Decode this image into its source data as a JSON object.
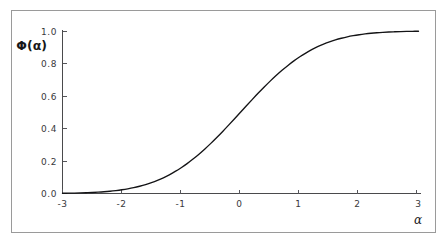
{
  "figure": {
    "background_color": "#ffffff",
    "frame_color": "#9a9a9a",
    "curve_color": "#141416",
    "axis_color": "#4a4a4c",
    "text_color": "#39393b"
  },
  "labels": {
    "y_axis_title": "Φ(α)",
    "x_axis_title": "α"
  },
  "ticks": {
    "x": [
      "-3",
      "-2",
      "-1",
      "0",
      "1",
      "2",
      "3"
    ],
    "y": [
      "0.0",
      "0.2",
      "0.4",
      "0.6",
      "0.8",
      "1.0"
    ]
  },
  "chart_data": {
    "type": "line",
    "title": "",
    "subtitle": "",
    "xlabel": "α",
    "ylabel": "Φ(α)",
    "xlim": [
      -3,
      3
    ],
    "ylim": [
      0.0,
      1.0
    ],
    "xticks": [
      -3,
      -2,
      -1,
      0,
      1,
      2,
      3
    ],
    "yticks": [
      0.0,
      0.2,
      0.4,
      0.6,
      0.8,
      1.0
    ],
    "grid": false,
    "legend": false,
    "legend_position": "none",
    "annotations": [],
    "series": [
      {
        "name": "Φ(α)",
        "color": "#141416",
        "x": [
          -3.0,
          -2.9,
          -2.8,
          -2.7,
          -2.6,
          -2.5,
          -2.4,
          -2.3,
          -2.2,
          -2.1,
          -2.0,
          -1.9,
          -1.8,
          -1.7,
          -1.6,
          -1.5,
          -1.4,
          -1.3,
          -1.2,
          -1.1,
          -1.0,
          -0.9,
          -0.8,
          -0.7,
          -0.6,
          -0.5,
          -0.4,
          -0.3,
          -0.2,
          -0.1,
          0.0,
          0.1,
          0.2,
          0.3,
          0.4,
          0.5,
          0.6,
          0.7,
          0.8,
          0.9,
          1.0,
          1.1,
          1.2,
          1.3,
          1.4,
          1.5,
          1.6,
          1.7,
          1.8,
          1.9,
          2.0,
          2.1,
          2.2,
          2.3,
          2.4,
          2.5,
          2.6,
          2.7,
          2.8,
          2.9,
          3.0
        ],
        "y": [
          0.0013,
          0.0019,
          0.0026,
          0.0035,
          0.0047,
          0.0062,
          0.0082,
          0.0107,
          0.0139,
          0.0179,
          0.0228,
          0.0287,
          0.0359,
          0.0446,
          0.0548,
          0.0668,
          0.0808,
          0.0968,
          0.1151,
          0.1357,
          0.1587,
          0.1841,
          0.2119,
          0.242,
          0.2743,
          0.3085,
          0.3446,
          0.3821,
          0.4207,
          0.4602,
          0.5,
          0.5398,
          0.5793,
          0.6179,
          0.6554,
          0.6915,
          0.7257,
          0.758,
          0.7881,
          0.8159,
          0.8413,
          0.8643,
          0.8849,
          0.9032,
          0.9192,
          0.9332,
          0.9452,
          0.9554,
          0.9641,
          0.9713,
          0.9772,
          0.9821,
          0.9861,
          0.9893,
          0.9918,
          0.9938,
          0.9953,
          0.9965,
          0.9974,
          0.9981,
          0.9987
        ]
      }
    ]
  }
}
